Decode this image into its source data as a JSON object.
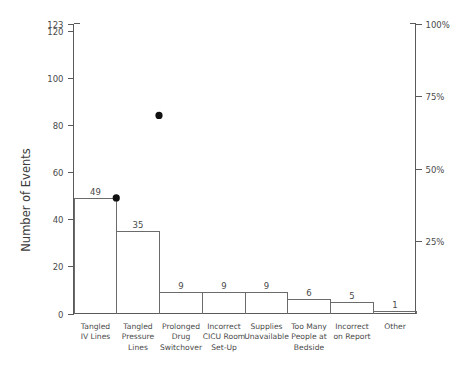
{
  "chart_data": {
    "type": "bar",
    "title": "",
    "xlabel": "",
    "ylabel": "Number of Events",
    "y2label": "",
    "categories": [
      "Tangled IV Lines",
      "Tangled Pressure Lines",
      "Prolonged Drug Switchover",
      "Incorrect CICU Room Set-Up",
      "Supplies Unavailable",
      "Too Many People at Bedside",
      "Incorrect on Report",
      "Other"
    ],
    "category_lines": [
      [
        "Tangled",
        "IV Lines"
      ],
      [
        "Tangled",
        "Pressure",
        "Lines"
      ],
      [
        "Prolonged",
        "Drug",
        "Switchover"
      ],
      [
        "Incorrect",
        "CICU Room",
        "Set-Up"
      ],
      [
        "Supplies",
        "Unavailable"
      ],
      [
        "Too Many",
        "People at",
        "Bedside"
      ],
      [
        "Incorrect",
        "on Report"
      ],
      [
        "Other"
      ]
    ],
    "values": [
      49,
      35,
      9,
      9,
      9,
      6,
      5,
      1
    ],
    "value_labels": [
      "49",
      "35",
      "9",
      "9",
      "9",
      "6",
      "5",
      "1"
    ],
    "ylim": [
      0,
      123
    ],
    "yticks": [
      0,
      20,
      40,
      60,
      80,
      100,
      120,
      123
    ],
    "ytick_labels": [
      "0",
      "20",
      "40",
      "60",
      "80",
      "100",
      "120",
      "123"
    ],
    "y2lim": [
      0,
      100
    ],
    "y2ticks": [
      25,
      50,
      75,
      100
    ],
    "y2tick_labels": [
      "25%",
      "50%",
      "75%",
      "100%"
    ],
    "cumulative_points": [
      {
        "category_index": 0,
        "value": 49
      },
      {
        "category_index": 1,
        "value": 84
      }
    ],
    "grid": false,
    "legend": "none",
    "total": 123,
    "colors": {
      "axis": "#5a5a5a",
      "bar_stroke": "#6b6b6b",
      "dot": "#111111",
      "text": "#4a4a4a",
      "background": "#ffffff"
    }
  }
}
